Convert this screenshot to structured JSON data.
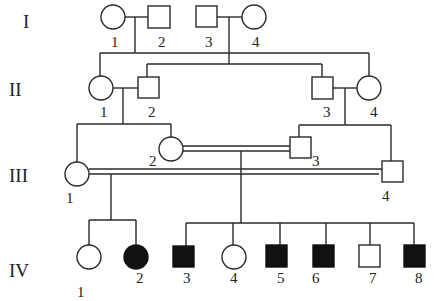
{
  "diagram": {
    "type": "pedigree chart",
    "colors": {
      "line": "#2a2a2a",
      "affected": "#111111",
      "unaffected": "#ffffff"
    },
    "generations": [
      {
        "id": "I",
        "label": "I"
      },
      {
        "id": "II",
        "label": "II"
      },
      {
        "id": "III",
        "label": "III"
      },
      {
        "id": "IV",
        "label": "IV"
      }
    ],
    "individuals": [
      {
        "id": "I-1",
        "label": "1",
        "sex": "female",
        "affected": false
      },
      {
        "id": "I-2",
        "label": "2",
        "sex": "male",
        "affected": false
      },
      {
        "id": "I-3",
        "label": "3",
        "sex": "male",
        "affected": false
      },
      {
        "id": "I-4",
        "label": "4",
        "sex": "female",
        "affected": false
      },
      {
        "id": "II-1",
        "label": "1",
        "sex": "female",
        "affected": false
      },
      {
        "id": "II-2",
        "label": "2",
        "sex": "male",
        "affected": false
      },
      {
        "id": "II-3",
        "label": "3",
        "sex": "male",
        "affected": false
      },
      {
        "id": "II-4",
        "label": "4",
        "sex": "female",
        "affected": false
      },
      {
        "id": "III-1",
        "label": "1",
        "sex": "female",
        "affected": false
      },
      {
        "id": "III-2",
        "label": "2",
        "sex": "female",
        "affected": false
      },
      {
        "id": "III-3",
        "label": "3",
        "sex": "male",
        "affected": false
      },
      {
        "id": "III-4",
        "label": "4",
        "sex": "male",
        "affected": false
      },
      {
        "id": "IV-1",
        "label": "1",
        "sex": "female",
        "affected": false
      },
      {
        "id": "IV-2",
        "label": "2",
        "sex": "female",
        "affected": true
      },
      {
        "id": "IV-3",
        "label": "3",
        "sex": "male",
        "affected": true
      },
      {
        "id": "IV-4",
        "label": "4",
        "sex": "female",
        "affected": false
      },
      {
        "id": "IV-5",
        "label": "5",
        "sex": "male",
        "affected": true
      },
      {
        "id": "IV-6",
        "label": "6",
        "sex": "male",
        "affected": true
      },
      {
        "id": "IV-7",
        "label": "7",
        "sex": "male",
        "affected": false
      },
      {
        "id": "IV-8",
        "label": "8",
        "sex": "male",
        "affected": true
      }
    ],
    "matings": [
      {
        "partners": [
          "I-1",
          "I-2"
        ],
        "consanguineous": false,
        "children": [
          "II-1",
          "II-4"
        ]
      },
      {
        "partners": [
          "I-3",
          "I-4"
        ],
        "consanguineous": false,
        "children": [
          "II-2",
          "II-3"
        ]
      },
      {
        "partners": [
          "II-1",
          "II-2"
        ],
        "consanguineous": false,
        "children": [
          "III-1",
          "III-2"
        ]
      },
      {
        "partners": [
          "II-3",
          "II-4"
        ],
        "consanguineous": false,
        "children": [
          "III-3",
          "III-4"
        ]
      },
      {
        "partners": [
          "III-2",
          "III-3"
        ],
        "consanguineous": true,
        "children": [
          "IV-3",
          "IV-4",
          "IV-5",
          "IV-6",
          "IV-7",
          "IV-8"
        ]
      },
      {
        "partners": [
          "III-1",
          "III-4"
        ],
        "consanguineous": true,
        "children": [
          "IV-1",
          "IV-2"
        ]
      }
    ]
  }
}
